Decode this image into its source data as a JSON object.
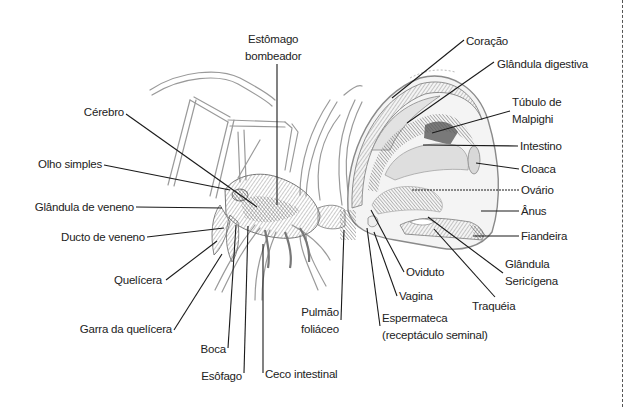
{
  "figure": {
    "labels": [
      {
        "id": "estomago-bombeador",
        "lines": [
          "Estômago",
          "bombeador"
        ]
      },
      {
        "id": "coracao",
        "lines": [
          "Coração"
        ]
      },
      {
        "id": "glandula-digestiva",
        "lines": [
          "Glândula digestiva"
        ]
      },
      {
        "id": "tubulo-de-malpighi",
        "lines": [
          "Túbulo de",
          "Malpighi"
        ]
      },
      {
        "id": "intestino",
        "lines": [
          "Intestino"
        ]
      },
      {
        "id": "cloaca",
        "lines": [
          "Cloaca"
        ]
      },
      {
        "id": "ovario",
        "lines": [
          "Ovário"
        ]
      },
      {
        "id": "anus",
        "lines": [
          "Ânus"
        ]
      },
      {
        "id": "fiandeira",
        "lines": [
          "Fiandeira"
        ]
      },
      {
        "id": "glandula-sericigena",
        "lines": [
          "Glândula",
          "Sericígena"
        ]
      },
      {
        "id": "traqueia",
        "lines": [
          "Traquéia"
        ]
      },
      {
        "id": "oviduto",
        "lines": [
          "Oviduto"
        ]
      },
      {
        "id": "vagina",
        "lines": [
          "Vagina"
        ]
      },
      {
        "id": "espermateca",
        "lines": [
          "Espermateca",
          "(receptáculo seminal)"
        ]
      },
      {
        "id": "pulmao-foliaceo",
        "lines": [
          "Pulmão",
          "foliáceo"
        ]
      },
      {
        "id": "ceco-intestinal",
        "lines": [
          "Ceco intestinal"
        ]
      },
      {
        "id": "esofago",
        "lines": [
          "Esôfago"
        ]
      },
      {
        "id": "boca",
        "lines": [
          "Boca"
        ]
      },
      {
        "id": "garra-da-quelicera",
        "lines": [
          "Garra da quelícera"
        ]
      },
      {
        "id": "quelicera",
        "lines": [
          "Quelícera"
        ]
      },
      {
        "id": "ducto-de-veneno",
        "lines": [
          "Ducto de veneno"
        ]
      },
      {
        "id": "glandula-de-veneno",
        "lines": [
          "Glândula de veneno"
        ]
      },
      {
        "id": "olho-simples",
        "lines": [
          "Olho simples"
        ]
      },
      {
        "id": "cerebro",
        "lines": [
          "Cérebro"
        ]
      }
    ]
  }
}
